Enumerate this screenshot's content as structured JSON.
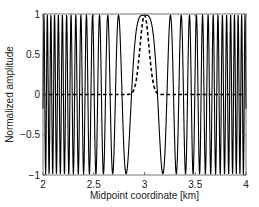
{
  "chart_data": {
    "type": "line",
    "title": "",
    "xlabel": "Midpoint coordinate [km]",
    "ylabel": "Normalized amplitude",
    "xlim": [
      2,
      4
    ],
    "ylim": [
      -1,
      1
    ],
    "xticks": [
      2,
      2.5,
      3,
      3.5,
      4
    ],
    "xtick_labels": [
      "2",
      "2.5",
      "3",
      "3.5",
      "4"
    ],
    "yticks": [
      -1,
      -0.5,
      0,
      0.5,
      1
    ],
    "ytick_labels": [
      "−1",
      "−0.5",
      "0",
      "0.5",
      "1"
    ],
    "grid": false,
    "legend": null,
    "series": [
      {
        "name": "chirp (solid)",
        "style": "solid",
        "color": "#000000",
        "formula": "cos(k*(x-3)^2)",
        "k": 96,
        "center": 3,
        "sample_x": [
          2.0,
          2.25,
          2.5,
          2.75,
          2.875,
          3.0,
          3.125,
          3.25,
          3.5,
          3.75,
          4.0
        ],
        "sample_y": [
          -0.98,
          0.74,
          -0.93,
          0.74,
          0.0,
          1.0,
          0.0,
          0.74,
          -0.93,
          0.74,
          -0.98
        ]
      },
      {
        "name": "Gaussian taper (dashed)",
        "style": "dashed",
        "color": "#000000",
        "formula": "exp(-((x-3)/sigma)^2)",
        "sigma": 0.062,
        "center": 3,
        "sample_x": [
          2.0,
          2.8,
          2.9,
          2.95,
          3.0,
          3.05,
          3.1,
          3.2,
          4.0
        ],
        "sample_y": [
          0.0,
          0.0,
          0.07,
          0.52,
          1.0,
          0.52,
          0.07,
          0.0,
          0.0
        ]
      }
    ]
  },
  "layout": {
    "plot": {
      "left": 43,
      "right": 246,
      "top": 14,
      "bottom": 175
    }
  }
}
